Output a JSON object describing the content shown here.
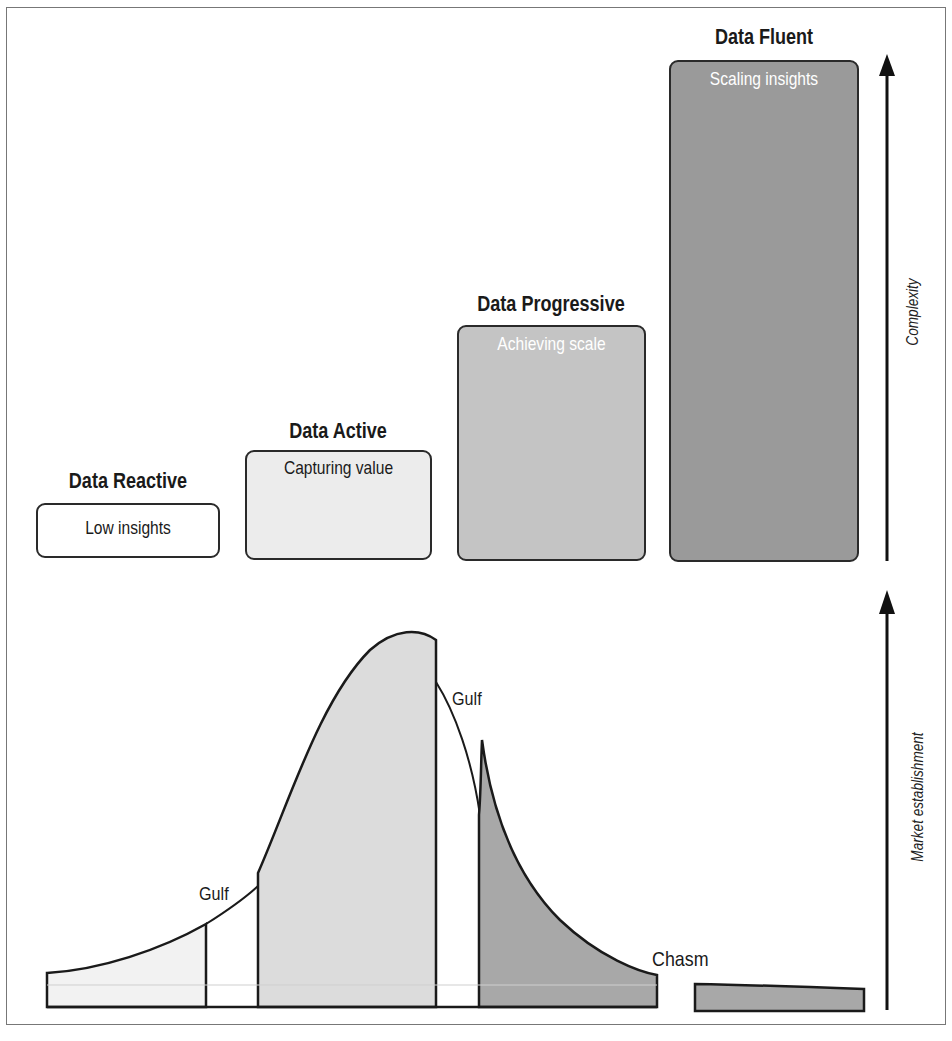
{
  "stages": [
    {
      "title": "Data Reactive",
      "label": "Low insights",
      "fill": "#ffffff",
      "label_color": "#1a1a1a"
    },
    {
      "title": "Data Active",
      "label": "Capturing value",
      "fill": "#ececec",
      "label_color": "#1a1a1a"
    },
    {
      "title": "Data Progressive",
      "label": "Achieving scale",
      "fill": "#c4c4c4",
      "label_color": "#ffffff"
    },
    {
      "title": "Data Fluent",
      "label": "Scaling insights",
      "fill": "#9a9a9a",
      "label_color": "#ffffff"
    }
  ],
  "axes": {
    "top": "Complexity",
    "bottom": "Market establishment"
  },
  "curve_labels": {
    "gulf_1": "Gulf",
    "gulf_2": "Gulf",
    "chasm": "Chasm"
  },
  "colors": {
    "outline": "#1a1a1a",
    "segment_1": "#f2f2f2",
    "segment_2": "#dcdcdc",
    "segment_3": "#a8a8a8",
    "segment_4": "#a8a8a8"
  }
}
